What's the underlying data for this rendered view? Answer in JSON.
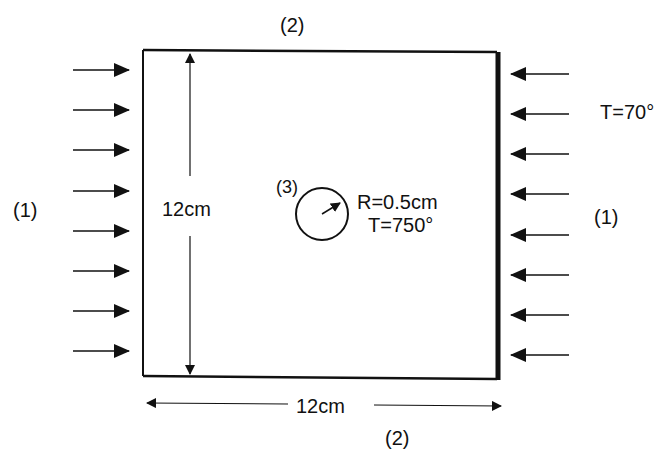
{
  "diagram": {
    "type": "heat-conduction-boundary-problem",
    "plate": {
      "width_label": "12cm",
      "height_label": "12cm"
    },
    "boundary_labels": {
      "left": "(1)",
      "right": "(1)",
      "top": "(2)",
      "bottom": "(2)",
      "hole": "(3)"
    },
    "hole": {
      "radius_label": "R=0.5cm",
      "temperature_label": "T=750°"
    },
    "right_side": {
      "temperature_label": "T=70°"
    },
    "arrows": {
      "left_count": 8,
      "right_count": 7
    },
    "colors": {
      "line": "#111111",
      "background": "#ffffff"
    }
  }
}
